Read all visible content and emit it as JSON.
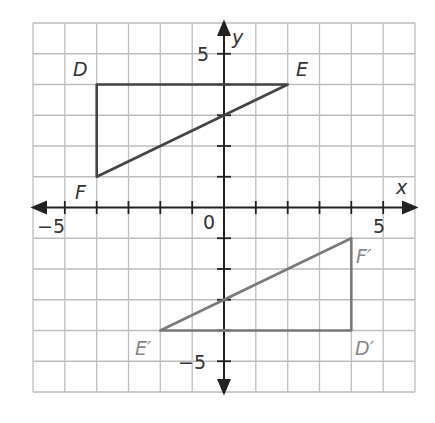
{
  "graph": {
    "x_axis_label": "x",
    "y_axis_label": "y",
    "origin_label": "0",
    "x_pos_tick_label": "5",
    "x_neg_tick_label": "−5",
    "y_pos_tick_label": "5",
    "y_neg_tick_label": "−5",
    "range": {
      "xmin": -6,
      "xmax": 6,
      "ymin": -6,
      "ymax": 6
    },
    "grid_color": "#bdbdbd",
    "axis_color": "#222222"
  },
  "triangles": [
    {
      "name": "DEF",
      "color": "#444444",
      "vertices": [
        {
          "label": "D",
          "x": -4,
          "y": 4
        },
        {
          "label": "E",
          "x": 2,
          "y": 4
        },
        {
          "label": "F",
          "x": -4,
          "y": 1
        }
      ]
    },
    {
      "name": "D'E'F'",
      "color": "#7a7a7a",
      "vertices": [
        {
          "label": "D′",
          "x": 4,
          "y": -4
        },
        {
          "label": "E′",
          "x": -2,
          "y": -4
        },
        {
          "label": "F′",
          "x": 4,
          "y": -1
        }
      ]
    }
  ]
}
